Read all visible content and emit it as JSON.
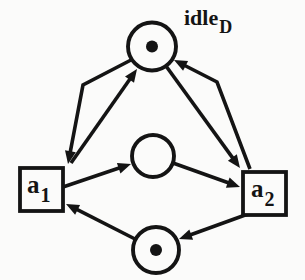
{
  "figure": {
    "kind": "petri-net",
    "ink_color": "#141414",
    "background_color": "#fbfbfa",
    "places": [
      {
        "id": "idle",
        "label": "idle",
        "label_subscript": "D",
        "has_token": true
      },
      {
        "id": "mid",
        "label": "",
        "label_subscript": "",
        "has_token": false
      },
      {
        "id": "bot",
        "label": "",
        "label_subscript": "",
        "has_token": true
      }
    ],
    "transitions": [
      {
        "id": "a1",
        "label": "a",
        "label_subscript": "1"
      },
      {
        "id": "a2",
        "label": "a",
        "label_subscript": "2"
      }
    ],
    "arcs": [
      {
        "from": "idle",
        "to": "a1"
      },
      {
        "from": "a1",
        "to": "idle"
      },
      {
        "from": "idle",
        "to": "a2"
      },
      {
        "from": "a2",
        "to": "idle"
      },
      {
        "from": "a1",
        "to": "mid"
      },
      {
        "from": "mid",
        "to": "a2"
      },
      {
        "from": "a2",
        "to": "bot"
      },
      {
        "from": "bot",
        "to": "a1"
      }
    ]
  }
}
